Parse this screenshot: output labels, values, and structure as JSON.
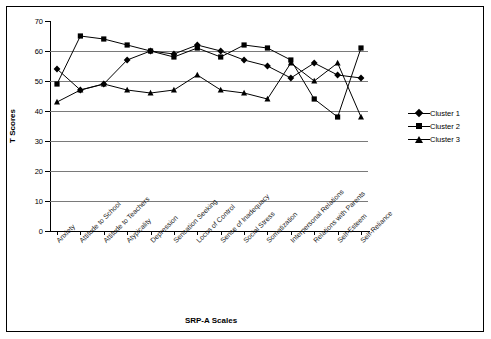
{
  "chart_data": {
    "type": "line",
    "title": "",
    "xlabel": "SRP-A Scales",
    "ylabel": "T Scores",
    "ylim": [
      0,
      70
    ],
    "ytick_step": 10,
    "yticks": [
      0,
      10,
      20,
      30,
      40,
      50,
      60,
      70
    ],
    "gridlines": [
      10,
      20,
      30,
      40,
      50,
      60
    ],
    "grid": true,
    "legend_position": "right",
    "categories": [
      "Anxiety",
      "Attitude to School",
      "Attitude to Teachers",
      "Atypicality",
      "Depression",
      "Sensation Seeking",
      "Locus of Control",
      "Sense of Inadequacy",
      "Social Stress",
      "Somatization",
      "Interpersonal Relations",
      "Relations with Parents",
      "Self-Esteem",
      "Self-Reliance"
    ],
    "series": [
      {
        "name": "Cluster 1",
        "marker": "diamond",
        "color": "#000000",
        "values": [
          54,
          47,
          49,
          57,
          60,
          59,
          62,
          60,
          57,
          55,
          51,
          56,
          52,
          51
        ]
      },
      {
        "name": "Cluster 2",
        "marker": "square",
        "color": "#000000",
        "values": [
          49,
          65,
          64,
          62,
          60,
          58,
          61,
          58,
          62,
          61,
          57,
          44,
          38,
          61
        ]
      },
      {
        "name": "Cluster 3",
        "marker": "triangle",
        "color": "#000000",
        "values": [
          43,
          47,
          49,
          47,
          46,
          47,
          52,
          47,
          46,
          44,
          56,
          50,
          56,
          38
        ]
      }
    ]
  },
  "legend": {
    "items": [
      {
        "label": "Cluster 1",
        "marker": "diamond"
      },
      {
        "label": "Cluster 2",
        "marker": "square"
      },
      {
        "label": "Cluster 3",
        "marker": "triangle"
      }
    ]
  }
}
